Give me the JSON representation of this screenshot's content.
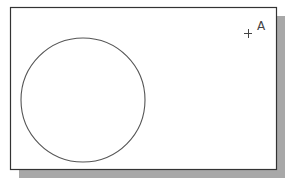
{
  "diagram": {
    "frame": {
      "x": 10,
      "y": 7,
      "width": 266,
      "height": 162,
      "stroke": "#333333",
      "fill": "#ffffff"
    },
    "shadow": {
      "offset_x": 9,
      "offset_y": 9,
      "color": "#a8a8a8"
    },
    "circle": {
      "cx": 83,
      "cy": 100,
      "r": 62,
      "stroke": "#555555"
    },
    "point": {
      "label": "A",
      "x": 248,
      "y": 33,
      "size": 7,
      "color": "#444444"
    }
  }
}
